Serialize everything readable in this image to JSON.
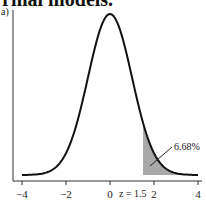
{
  "heading": "rmal models.",
  "panel_label": "a)",
  "chart_data": {
    "type": "area",
    "title": "",
    "distribution": "standard normal",
    "xlabel": "",
    "ylabel": "",
    "xlim": [
      -4,
      4
    ],
    "x_ticks": [
      -4,
      -2,
      0,
      2,
      4
    ],
    "x_tick_labels": [
      "-4",
      "-2",
      "0",
      "2",
      "4"
    ],
    "shaded_region": {
      "from": 1.5,
      "to": 4,
      "color": "#a9a9a9"
    },
    "cutoff_label": "z = 1.5",
    "annotation": "6.68%",
    "grid": false,
    "curve_color": "#111111"
  }
}
